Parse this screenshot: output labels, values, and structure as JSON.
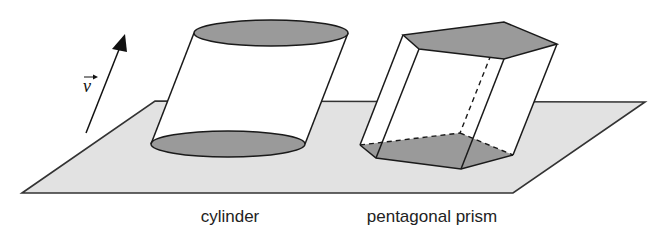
{
  "diagram": {
    "colors": {
      "plane_fill": "#e2e2e2",
      "base_fill": "#9a9a9a",
      "stroke": "#1a1a1a",
      "solid_fill": "#ffffff"
    },
    "vector": {
      "label": "v"
    },
    "shapes": [
      {
        "id": "cylinder",
        "label": "cylinder"
      },
      {
        "id": "pentagonal-prism",
        "label": "pentagonal prism"
      }
    ]
  }
}
